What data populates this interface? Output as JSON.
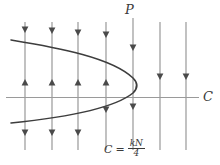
{
  "figure": {
    "type": "phase-plane-slope-field",
    "width": 220,
    "height": 165,
    "background": "#ffffff",
    "curve_color": "#3d3d3d",
    "axis_color": "#9a9a9a",
    "flow_line_color": "#8f8f8f",
    "arrow_color": "#4a4a4a",
    "text_color": "#3a3a3a"
  },
  "labels": {
    "vertical_axis": "P",
    "horizontal_axis": "C",
    "vertex_equation_lhs": "C",
    "vertex_equation_eq": "=",
    "vertex_equation_numerator": "kN",
    "vertex_equation_denominator": "4"
  },
  "axes": {
    "horizontal_y": 97.5,
    "horizontal_x_start": 6,
    "horizontal_x_end": 199,
    "vertical_x": 133,
    "vertical_y_start": 18,
    "vertical_y_end": 150
  },
  "parabola": {
    "description": "sideways parabola opening to the left with vertex on the C axis",
    "vertex": {
      "x": 136,
      "y": 85
    },
    "upper_branch_start": {
      "x": 11,
      "y": 40
    },
    "lower_branch_start": {
      "x": 11,
      "y": 123
    },
    "crosses_horizontal_axis_at_x": 110,
    "path": "M 11,40 C 60,48 112,58 133,78 C 138,83 138,88 133,93 C 112,110 60,118 11,123"
  },
  "flow_lines": [
    {
      "x": 25,
      "y_top": 22,
      "y_bottom": 150,
      "arrows": [
        {
          "y": 33,
          "dir": "down"
        },
        {
          "y": 79,
          "dir": "up"
        },
        {
          "y": 136,
          "dir": "down"
        }
      ]
    },
    {
      "x": 52,
      "y_top": 22,
      "y_bottom": 150,
      "arrows": [
        {
          "y": 34,
          "dir": "down"
        },
        {
          "y": 79,
          "dir": "up"
        },
        {
          "y": 136,
          "dir": "down"
        }
      ]
    },
    {
      "x": 78,
      "y_top": 22,
      "y_bottom": 150,
      "arrows": [
        {
          "y": 36,
          "dir": "down"
        },
        {
          "y": 79,
          "dir": "up"
        },
        {
          "y": 136,
          "dir": "down"
        }
      ]
    },
    {
      "x": 106,
      "y_top": 22,
      "y_bottom": 150,
      "arrows": [
        {
          "y": 38,
          "dir": "down"
        },
        {
          "y": 79,
          "dir": "up"
        },
        {
          "y": 113,
          "dir": "down"
        }
      ]
    },
    {
      "x": 133,
      "y_top": 18,
      "y_bottom": 150,
      "arrows": [
        {
          "y": 51,
          "dir": "down"
        },
        {
          "y": 110,
          "dir": "down"
        }
      ]
    },
    {
      "x": 160,
      "y_top": 22,
      "y_bottom": 150,
      "arrows": [
        {
          "y": 80,
          "dir": "down"
        }
      ]
    },
    {
      "x": 186,
      "y_top": 22,
      "y_bottom": 150,
      "arrows": [
        {
          "y": 80,
          "dir": "down"
        }
      ]
    }
  ]
}
